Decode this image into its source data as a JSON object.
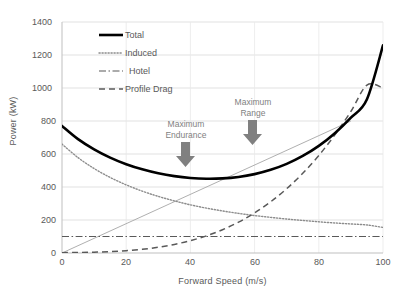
{
  "chart_data": {
    "type": "line",
    "title": "",
    "xlabel": "Forward Speed (m/s)",
    "ylabel": "Power (kW)",
    "xlim": [
      0,
      100
    ],
    "ylim": [
      0,
      1400
    ],
    "xticks": [
      "0",
      "20",
      "40",
      "60",
      "80",
      "100"
    ],
    "yticks": [
      "0",
      "200",
      "400",
      "600",
      "800",
      "1000",
      "1200",
      "1400"
    ],
    "grid": true,
    "legend_position": "upper-left-inside",
    "x": [
      0,
      5,
      10,
      15,
      20,
      25,
      30,
      35,
      40,
      45,
      50,
      55,
      60,
      65,
      70,
      75,
      80,
      85,
      90,
      95,
      100
    ],
    "series": [
      {
        "name": "Total",
        "style": "solid-thick",
        "color": "#000000",
        "values": [
          770,
          690,
          628,
          578,
          538,
          507,
          483,
          466,
          455,
          450,
          452,
          461,
          478,
          504,
          540,
          588,
          649,
          726,
          820,
          932,
          1258
        ]
      },
      {
        "name": "Induced",
        "style": "dotted",
        "color": "#808080",
        "values": [
          660,
          578,
          512,
          458,
          413,
          375,
          343,
          316,
          292,
          272,
          255,
          240,
          227,
          216,
          206,
          197,
          189,
          182,
          176,
          170,
          155
        ]
      },
      {
        "name": "Hotel",
        "style": "dash-dot",
        "color": "#595959",
        "values": [
          100,
          100,
          100,
          100,
          100,
          100,
          100,
          100,
          100,
          100,
          100,
          100,
          100,
          100,
          100,
          100,
          100,
          100,
          100,
          100,
          100
        ]
      },
      {
        "name": "Profile Drag",
        "style": "dashed",
        "color": "#595959",
        "values": [
          2,
          3,
          5,
          8,
          14,
          22,
          35,
          52,
          75,
          104,
          141,
          187,
          243,
          310,
          390,
          483,
          591,
          716,
          858,
          1018,
          1000
        ]
      }
    ],
    "tangent_line": {
      "name": "range-tangent",
      "x": [
        0,
        90
      ],
      "values": [
        0,
        800
      ],
      "color": "#a6a6a6"
    },
    "annotations": [
      {
        "name": "maximum-endurance",
        "text": "Maximum\nEndurance",
        "x": 38,
        "y": 600,
        "arrow": "down"
      },
      {
        "name": "maximum-range",
        "text": "Maximum\nRange",
        "x": 59,
        "y": 760,
        "arrow": "down"
      }
    ]
  },
  "legend": {
    "items": [
      {
        "label": "Total",
        "key": "total"
      },
      {
        "label": "Induced",
        "key": "induced"
      },
      {
        "label": "Hotel",
        "key": "hotel"
      },
      {
        "label": "Profile Drag",
        "key": "profile-drag"
      }
    ]
  },
  "colors": {
    "axis_text": "#595959",
    "grid": "#d9d9d9",
    "total": "#000000",
    "induced": "#808080",
    "hotel": "#595959",
    "profile_drag": "#595959",
    "annotation": "#7f7f7f"
  }
}
